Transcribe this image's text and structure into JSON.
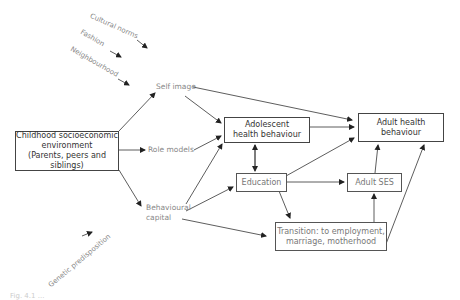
{
  "diagram": {
    "influences": [
      {
        "id": "cultural",
        "label": "Cultural norms"
      },
      {
        "id": "fashion",
        "label": "Fashion"
      },
      {
        "id": "neighbourhood",
        "label": "Neighbourhood"
      },
      {
        "id": "genetic",
        "label": "Genetic predisposition"
      }
    ],
    "nodes": {
      "childhood": {
        "line1": "Childhood socioeconomic",
        "line2": "environment",
        "line3": "(Parents, peers and siblings)"
      },
      "self_image": {
        "label": "Self image"
      },
      "role_models": {
        "label": "Role models"
      },
      "behavioural_capital": {
        "line1": "Behavioural",
        "line2": "capital"
      },
      "adolescent": {
        "line1": "Adolescent",
        "line2": "health behaviour"
      },
      "adult_health": {
        "line1": "Adult health",
        "line2": "behaviour"
      },
      "education": {
        "label": "Education"
      },
      "adult_ses": {
        "label": "Adult SES"
      },
      "transition": {
        "line1": "Transition:  to employment,",
        "line2": "marriage, motherhood"
      }
    },
    "edges": [
      [
        "childhood",
        "self_image"
      ],
      [
        "childhood",
        "role_models"
      ],
      [
        "childhood",
        "behavioural_capital"
      ],
      [
        "self_image",
        "adolescent"
      ],
      [
        "self_image",
        "adult_health"
      ],
      [
        "role_models",
        "adolescent"
      ],
      [
        "behavioural_capital",
        "adolescent"
      ],
      [
        "behavioural_capital",
        "education"
      ],
      [
        "behavioural_capital",
        "transition"
      ],
      [
        "adolescent",
        "adult_health"
      ],
      [
        "adolescent",
        "education"
      ],
      [
        "education",
        "adolescent"
      ],
      [
        "education",
        "adult_health"
      ],
      [
        "education",
        "adult_ses"
      ],
      [
        "education",
        "transition"
      ],
      [
        "adult_ses",
        "adult_health"
      ],
      [
        "transition",
        "adult_ses"
      ],
      [
        "transition",
        "adult_health"
      ]
    ],
    "caption": "Fig. 4.1 ..."
  }
}
